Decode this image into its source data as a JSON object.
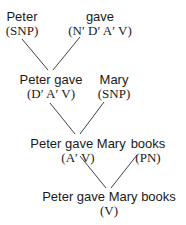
{
  "diagram": {
    "type": "derivation-tree",
    "nodes": [
      {
        "id": "n1",
        "word": "Peter",
        "category": "(SNP)"
      },
      {
        "id": "n2",
        "word": "gave",
        "category": "(N′ D′ A′ V)"
      },
      {
        "id": "n3",
        "word": "Peter gave",
        "category": "(D′ A′ V)"
      },
      {
        "id": "n4",
        "word": "Mary",
        "category": "(SNP)"
      },
      {
        "id": "n5",
        "word": "Peter gave Mary",
        "category": "(A′ V)"
      },
      {
        "id": "n6",
        "word": "books",
        "category": "(PN)"
      },
      {
        "id": "n7",
        "word": "Peter gave Mary books",
        "category": "(V)"
      }
    ],
    "edges": [
      {
        "from": "n1",
        "to": "n3"
      },
      {
        "from": "n2",
        "to": "n3"
      },
      {
        "from": "n3",
        "to": "n5"
      },
      {
        "from": "n4",
        "to": "n5"
      },
      {
        "from": "n5",
        "to": "n7"
      },
      {
        "from": "n6",
        "to": "n7"
      }
    ]
  }
}
